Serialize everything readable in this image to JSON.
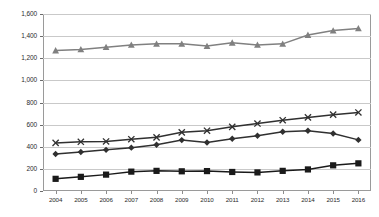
{
  "chart_data": {
    "type": "line",
    "title": "",
    "xlabel": "",
    "ylabel": "",
    "categories": [
      "2004",
      "2005",
      "2006",
      "2007",
      "2008",
      "2009",
      "2010",
      "2011",
      "2012",
      "2013",
      "2014",
      "2015",
      "2016"
    ],
    "ylim": [
      0,
      1600
    ],
    "ytick_step": 200,
    "ytick_labels": [
      "1,600",
      "1,400",
      "1,200",
      "1,000",
      "800",
      "600",
      "400",
      "200",
      "0"
    ],
    "ytick_values": [
      1600,
      1400,
      1200,
      1000,
      800,
      600,
      400,
      200,
      0
    ],
    "grid": true,
    "legend_position": "bottom",
    "series": [
      {
        "name": "series-1",
        "marker": "triangle",
        "color": "#808080",
        "values": [
          1270,
          1280,
          1300,
          1320,
          1330,
          1330,
          1310,
          1340,
          1320,
          1330,
          1410,
          1450,
          1470
        ]
      },
      {
        "name": "series-2",
        "marker": "cross",
        "color": "#303030",
        "values": [
          435,
          445,
          448,
          468,
          485,
          530,
          545,
          580,
          610,
          640,
          665,
          690,
          710
        ]
      },
      {
        "name": "series-3",
        "marker": "diamond",
        "color": "#303030",
        "values": [
          335,
          352,
          372,
          392,
          418,
          460,
          438,
          472,
          500,
          535,
          545,
          520,
          462
        ]
      },
      {
        "name": "series-4",
        "marker": "square",
        "color": "#1a1a1a",
        "values": [
          110,
          128,
          148,
          175,
          182,
          178,
          180,
          172,
          168,
          182,
          195,
          232,
          250
        ]
      }
    ],
    "legend_labels": [
      "",
      "",
      "",
      ""
    ]
  }
}
